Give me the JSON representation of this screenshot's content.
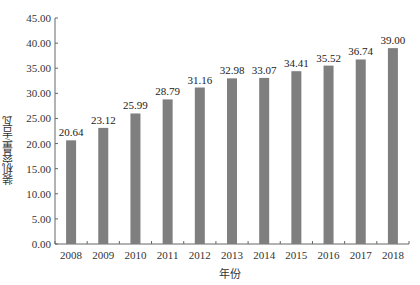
{
  "chart_data": {
    "type": "bar",
    "title": "",
    "xlabel": "年份",
    "ylabel": "装机容量/吉瓦",
    "categories": [
      "2008",
      "2009",
      "2010",
      "2011",
      "2012",
      "2013",
      "2014",
      "2015",
      "2016",
      "2017",
      "2018"
    ],
    "values": [
      20.64,
      23.12,
      25.99,
      28.79,
      31.16,
      32.98,
      33.07,
      34.41,
      35.52,
      36.74,
      39.0
    ],
    "data_labels": [
      "20.64",
      "23.12",
      "25.99",
      "28.79",
      "31.16",
      "32.98",
      "33.07",
      "34.41",
      "35.52",
      "36.74",
      "39.00"
    ],
    "ylim": [
      0,
      45
    ],
    "yticks": [
      "0.00",
      "5.00",
      "10.00",
      "15.00",
      "20.00",
      "25.00",
      "30.00",
      "35.00",
      "40.00",
      "45.00"
    ],
    "grid": false,
    "legend": null,
    "bar_color": "#7f7f7f"
  }
}
